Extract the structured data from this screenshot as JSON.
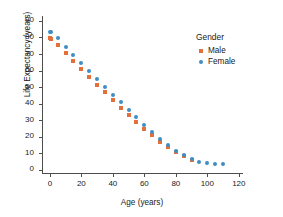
{
  "chart_data": {
    "type": "scatter",
    "title": "",
    "xlabel": "Age (years)",
    "ylabel": "Life Expectancy (years)",
    "xlim": [
      -5,
      122
    ],
    "ylim": [
      -2,
      93
    ],
    "xticks": [
      0,
      20,
      40,
      60,
      80,
      100,
      120
    ],
    "yticks": [
      0,
      10,
      20,
      30,
      40,
      50,
      60,
      70,
      80,
      90
    ],
    "grid": false,
    "legend_position": "top-right",
    "legend_title": "Gender",
    "series": [
      {
        "name": "Male",
        "color": "#e2703a",
        "marker": "square",
        "x": [
          0,
          1,
          5,
          10,
          15,
          20,
          25,
          30,
          35,
          40,
          45,
          50,
          55,
          60,
          65,
          70,
          75,
          80,
          85,
          90
        ],
        "y": [
          79.5,
          79.0,
          75.3,
          70.6,
          65.8,
          61.0,
          56.2,
          51.5,
          46.8,
          42.2,
          37.6,
          33.2,
          28.9,
          24.7,
          20.7,
          17.0,
          13.6,
          10.6,
          8.1,
          6.1
        ]
      },
      {
        "name": "Female",
        "color": "#3d8ec4",
        "marker": "circle",
        "x": [
          0,
          1,
          5,
          10,
          15,
          20,
          25,
          30,
          35,
          40,
          45,
          50,
          55,
          60,
          65,
          70,
          75,
          80,
          85,
          90,
          95,
          100,
          105,
          110
        ],
        "y": [
          83.6,
          83.2,
          79.4,
          74.5,
          69.6,
          64.8,
          59.9,
          55.1,
          50.3,
          45.5,
          40.8,
          36.2,
          31.6,
          27.2,
          22.9,
          18.8,
          15.0,
          11.5,
          8.6,
          6.3,
          4.6,
          3.8,
          3.4,
          3.2
        ]
      }
    ]
  },
  "legend": {
    "title": "Gender",
    "entries": [
      {
        "label": "Male",
        "color": "#e2703a",
        "marker": "square"
      },
      {
        "label": "Female",
        "color": "#3d8ec4",
        "marker": "circle"
      }
    ]
  },
  "axes": {
    "x_title": "Age (years)",
    "y_title": "Life Expectancy (years)"
  },
  "colors": {
    "male": "#e2703a",
    "female": "#3d8ec4",
    "axis": "#4d4d4d",
    "text": "#1a1a1a",
    "background": "#ffffff"
  }
}
